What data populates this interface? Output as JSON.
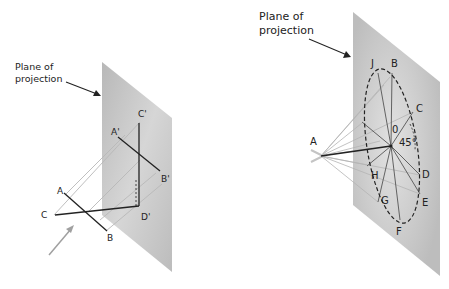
{
  "left_figure": {
    "plane_label_line1": "Plane of",
    "plane_label_line2": "projection",
    "points": {
      "A": "A",
      "B": "B",
      "C": "C",
      "A_prime": "A'",
      "B_prime": "B'",
      "C_prime": "C'",
      "D_prime": "D'"
    }
  },
  "right_figure": {
    "plane_label_line1": "Plane of",
    "plane_label_line2": "projection",
    "points": {
      "A": "A",
      "B": "B",
      "C": "C",
      "D": "D",
      "E": "E",
      "F": "F",
      "G": "G",
      "H": "H",
      "J": "J",
      "O": "0"
    },
    "angle_label": "45°"
  },
  "colors": {
    "plane_gray": "#c4c4c4",
    "line_dark": "#222222",
    "projector_gray": "#b0b0b0",
    "arrow_gray": "#a0a0a0"
  }
}
